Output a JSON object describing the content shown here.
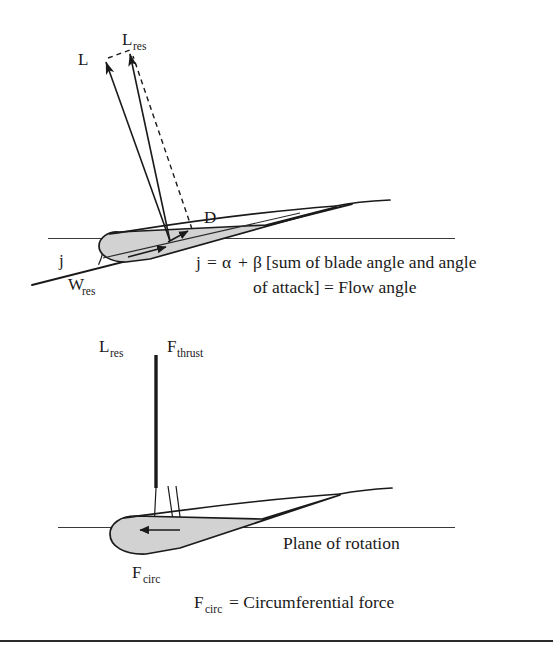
{
  "figure": {
    "background_color": "#ffffff",
    "ink_color": "#1a1a1a",
    "airfoil_fill_color": "#d2d2d2"
  },
  "upper_diagram": {
    "name": "Flow angle and lift-drag resolution",
    "labels": {
      "lift": {
        "base": "L",
        "sub": ""
      },
      "lift_resultant": {
        "base": "L",
        "sub": "res"
      },
      "drag": {
        "base": "D",
        "sub": ""
      },
      "relative_wind": {
        "base": "W",
        "sub": "res"
      },
      "flow_angle_marker": "j"
    },
    "caption_line_1_parts": {
      "symbol": "j",
      "equals": "=",
      "alpha": "α",
      "plus": "+",
      "beta": "β",
      "bracket_text": "[sum of blade angle and angle"
    },
    "caption_line_2": "of attack] = Flow angle",
    "caption_full": "j = α + β [sum of blade angle and angle of attack] = Flow angle"
  },
  "lower_diagram": {
    "name": "Thrust and circumferential force resolution",
    "labels": {
      "lift_resultant": {
        "base": "L",
        "sub": "res"
      },
      "thrust": {
        "base": "F",
        "sub": "thrust"
      },
      "circumferential": {
        "base": "F",
        "sub": "circ"
      },
      "plane_of_rotation": "Plane of rotation"
    },
    "caption_parts": {
      "symbol_base": "F",
      "symbol_sub": "circ",
      "equals_text": "= Circumferential force"
    },
    "caption_full": "F circ = Circumferential force"
  }
}
